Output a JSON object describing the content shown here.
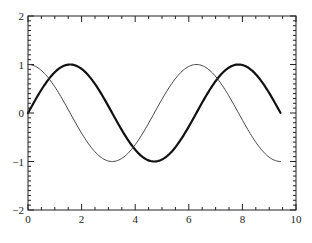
{
  "chart_data": {
    "type": "line",
    "title": "",
    "xlabel": "",
    "ylabel": "",
    "xlim": [
      0,
      10
    ],
    "ylim": [
      -2,
      2
    ],
    "grid": false,
    "legend": null,
    "frame": "box",
    "tick_direction": "in",
    "x_major_ticks": [
      0,
      2,
      4,
      6,
      8,
      10
    ],
    "x_tick_labels": [
      "0",
      "2",
      "4",
      "6",
      "8",
      "10"
    ],
    "x_minor_step": 0.5,
    "y_major_ticks": [
      -2,
      -1,
      0,
      1,
      2
    ],
    "y_tick_labels": [
      "−2",
      "−1",
      "0",
      "1",
      "2"
    ],
    "y_minor_step": 0.1,
    "x_range_data": [
      0,
      9.42
    ],
    "series": [
      {
        "name": "sin(x)",
        "function": "sin",
        "style": "thick",
        "color": "#111111",
        "line_width": 2.2,
        "x": [
          0,
          0.785,
          1.571,
          2.356,
          3.142,
          3.927,
          4.712,
          5.498,
          6.283,
          7.069,
          7.854,
          8.639,
          9.425
        ],
        "values": [
          0,
          0.71,
          1,
          0.71,
          0,
          -0.71,
          -1,
          -0.71,
          0,
          0.71,
          1,
          0.71,
          0
        ]
      },
      {
        "name": "cos(x)",
        "function": "cos",
        "style": "thin",
        "color": "#444444",
        "line_width": 1.0,
        "x": [
          0,
          0.785,
          1.571,
          2.356,
          3.142,
          3.927,
          4.712,
          5.498,
          6.283,
          7.069,
          7.854,
          8.639,
          9.425
        ],
        "values": [
          1,
          0.71,
          0,
          -0.71,
          -1,
          -0.71,
          0,
          0.71,
          1,
          0.71,
          0,
          -0.71,
          -1
        ]
      }
    ]
  },
  "layout": {
    "plot_left": 28,
    "plot_right": 296,
    "plot_top": 16,
    "plot_bottom": 210
  }
}
